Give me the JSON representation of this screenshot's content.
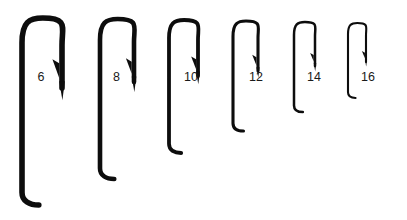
{
  "figure": {
    "background_color": "#ffffff",
    "hook_color": "#0d0d0d",
    "label_color": "#1a1a1a",
    "hook_count": 6
  },
  "chart_data": {
    "type": "table",
    "xlabel": "",
    "ylabel": "",
    "categories": [
      "6",
      "8",
      "10",
      "12",
      "14",
      "16"
    ],
    "values": [
      187,
      160,
      133,
      110,
      90,
      75
    ],
    "series": [
      {
        "name": "Overall hook length (px)",
        "values": [
          187,
          160,
          133,
          110,
          90,
          75
        ]
      },
      {
        "name": "Gape width (px)",
        "values": [
          40,
          34,
          29,
          25,
          21,
          18
        ]
      },
      {
        "name": "Stroke weight (px)",
        "values": [
          5.6,
          4.6,
          3.8,
          3.1,
          2.5,
          2.1
        ]
      }
    ]
  },
  "hooks": [
    {
      "size_label": "6",
      "name": "hook-size-6",
      "shank_x": 22.0,
      "point_x": 62.0,
      "top_y": 18.0,
      "shank_bottom_y": 205.0,
      "point_tip_y": 88.0,
      "stroke": 5.6,
      "label_x": 41.0,
      "label_y": 78.0
    },
    {
      "size_label": "8",
      "name": "hook-size-8",
      "shank_x": 100.0,
      "point_x": 134.0,
      "top_y": 19.0,
      "shank_bottom_y": 179.0,
      "point_tip_y": 82.0,
      "stroke": 4.6,
      "label_x": 116.5,
      "label_y": 78.0
    },
    {
      "size_label": "10",
      "name": "hook-size-10",
      "shank_x": 169.0,
      "point_x": 198.0,
      "top_y": 20.0,
      "shank_bottom_y": 153.0,
      "point_tip_y": 76.0,
      "stroke": 3.8,
      "label_x": 191.0,
      "label_y": 78.0
    },
    {
      "size_label": "12",
      "name": "hook-size-12",
      "shank_x": 233.0,
      "point_x": 258.0,
      "top_y": 21.0,
      "shank_bottom_y": 131.0,
      "point_tip_y": 71.0,
      "stroke": 3.1,
      "label_x": 256.0,
      "label_y": 78.0
    },
    {
      "size_label": "14",
      "name": "hook-size-14",
      "shank_x": 294.0,
      "point_x": 315.0,
      "top_y": 22.0,
      "shank_bottom_y": 112.0,
      "point_tip_y": 66.0,
      "stroke": 2.5,
      "label_x": 314.0,
      "label_y": 78.0
    },
    {
      "size_label": "16",
      "name": "hook-size-16",
      "shank_x": 348.0,
      "point_x": 366.0,
      "top_y": 23.0,
      "shank_bottom_y": 98.0,
      "point_tip_y": 62.0,
      "stroke": 2.1,
      "label_x": 368.0,
      "label_y": 78.0
    }
  ]
}
